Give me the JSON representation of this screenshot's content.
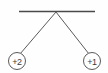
{
  "figure": {
    "name": "two-suspended-charges-diagram",
    "background_color": "#fefefe",
    "width": 108,
    "height": 73,
    "line_color": "#5a5a5a",
    "bar_color": "#4a4a4a",
    "text_color": "#3a3a3a"
  },
  "support": {
    "label": "support-bar",
    "x1": 19,
    "y1": 11.5,
    "x2": 95,
    "y2": 11.5
  },
  "pivot": {
    "label": "pivot-point",
    "x": 56,
    "y": 12
  },
  "strings": [
    {
      "name": "left-string",
      "x1": 56,
      "y1": 12,
      "x2": 20,
      "y2": 54
    },
    {
      "name": "right-string",
      "x1": 56,
      "y1": 12,
      "x2": 89,
      "y2": 54
    }
  ],
  "charges": [
    {
      "name": "charge-left",
      "label": "+2",
      "cx": 17,
      "cy": 61,
      "r": 8.5
    },
    {
      "name": "charge-right",
      "label": "+1",
      "cx": 92,
      "cy": 61,
      "r": 8.5
    }
  ]
}
